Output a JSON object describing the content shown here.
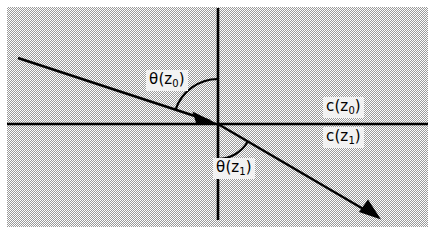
{
  "figure": {
    "name": "refraction-at-interface",
    "panel": {
      "background": "#d8d8d8",
      "border_margin_color": "#ffffff",
      "x": 7,
      "y": 7,
      "width": 421,
      "height": 220
    },
    "line_color": "#000000",
    "origin": {
      "x": 218,
      "y": 124
    }
  },
  "axes": {
    "vertical": {
      "x": 218,
      "y_top": 8,
      "y_bottom": 220
    },
    "horizontal": {
      "y": 124,
      "x_left": 7,
      "x_right": 428
    }
  },
  "rays": {
    "incident": {
      "label": "incident-ray",
      "from": {
        "x": 18,
        "y": 58
      },
      "to": {
        "x": 218,
        "y": 124
      },
      "arrowhead_at": "to"
    },
    "refracted": {
      "label": "refracted-ray",
      "from": {
        "x": 218,
        "y": 124
      },
      "to": {
        "x": 380,
        "y": 219
      },
      "arrowhead_at": "to"
    }
  },
  "arcs": {
    "upper": {
      "label": "angle-arc-theta-z0",
      "radius": 45
    },
    "lower": {
      "label": "angle-arc-theta-z1",
      "radius": 35
    }
  },
  "labels": {
    "theta_z0": {
      "symbol": "θ",
      "open": "(",
      "variable": "z",
      "subscript": "0",
      "close": ")"
    },
    "theta_z1": {
      "symbol": "θ",
      "open": "(",
      "variable": "z",
      "subscript": "1",
      "close": ")"
    },
    "c_z0": {
      "symbol": "c",
      "open": "(",
      "variable": "z",
      "subscript": "0",
      "close": ")"
    },
    "c_z1": {
      "symbol": "c",
      "open": "(",
      "variable": "z",
      "subscript": "1",
      "close": ")"
    }
  }
}
